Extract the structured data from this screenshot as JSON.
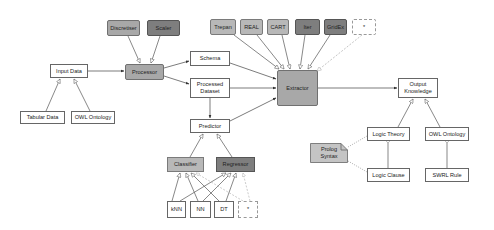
{
  "diagram": {
    "processors": {
      "discretiser": "Discretiser",
      "scaler": "Scaler",
      "processor": "Processor"
    },
    "input": {
      "input_data": "Input Data",
      "tabular_data": "Tabular Data",
      "owl_ontology": "OWL Ontology"
    },
    "data": {
      "schema": "Schema",
      "processed_dataset_line1": "Processed",
      "processed_dataset_line2": "Dataset"
    },
    "extractors": {
      "items": [
        "Trepan",
        "REAL",
        "CART",
        "Iter",
        "GridEx",
        "*"
      ],
      "extractor": "Extractor"
    },
    "predictor": {
      "predictor": "Predictor",
      "classifier": "Classifier",
      "regressor": "Regressor",
      "models": [
        "kNN",
        "NN",
        "DT",
        "*"
      ]
    },
    "output": {
      "output_knowledge_line1": "Output",
      "output_knowledge_line2": "Knowledge",
      "logic_theory": "Logic Theory",
      "owl_ontology": "OWL Ontology",
      "logic_clause": "Logic Clause",
      "swrl_rule": "SWRL Rule",
      "prolog_note_line1": "Prolog",
      "prolog_note_line2": "Syntax"
    },
    "colors": {
      "light_fill": "#b8b8b8",
      "mid_fill": "#a8a8a8",
      "dark_fill": "#7e7e7e",
      "line": "#444444"
    }
  }
}
